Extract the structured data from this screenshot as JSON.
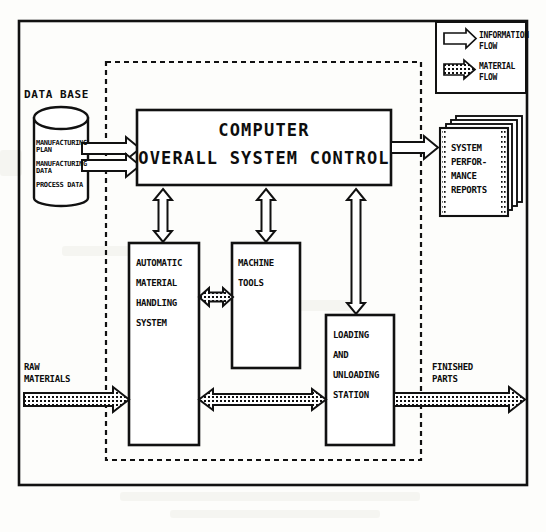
{
  "diagram": {
    "legend": {
      "items": [
        {
          "id": "information-flow",
          "label": "INFORMATION\nFLOW",
          "style": "hollow-arrow"
        },
        {
          "id": "material-flow",
          "label": "MATERIAL\nFLOW",
          "style": "hatched-arrow"
        }
      ]
    },
    "nodes": {
      "database": {
        "title": "DATA BASE",
        "shape": "cylinder",
        "lines": [
          "MANUFACTURING\nPLAN",
          "MANUFACTURING\nDATA",
          "PROCESS DATA"
        ]
      },
      "computer": {
        "line1": "COMPUTER",
        "line2": "OVERALL SYSTEM CONTROL"
      },
      "reports": {
        "label": "SYSTEM\nPERFOR-\nMANCE\nREPORTS",
        "shape": "page-stack",
        "pages": 4
      },
      "amhs": {
        "label": "AUTOMATIC\n\nMATERIAL\n\nHANDLING\n\nSYSTEM"
      },
      "machine_tools": {
        "label": "MACHINE\n\nTOOLS"
      },
      "loading_station": {
        "label": "LOADING\n\nAND\n\nUNLOADING\n\nSTATION"
      }
    },
    "io": {
      "input": "RAW\nMATERIALS",
      "output": "FINISHED\nPARTS"
    },
    "colors": {
      "ink": "#0d0d0d",
      "paper": "#fdfdfb",
      "fill": "#ffffff"
    }
  }
}
